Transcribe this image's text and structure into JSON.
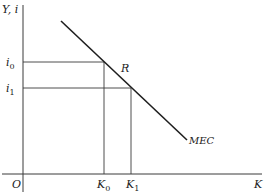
{
  "diagram": {
    "axes": {
      "y_label": "Y, i",
      "x_label": "K",
      "origin_label": "O"
    },
    "curve": {
      "label": "MEC",
      "start": [
        61,
        21
      ],
      "end": [
        187,
        140
      ]
    },
    "point": {
      "label": "R"
    },
    "levels": {
      "i0": {
        "base": "i",
        "sub": "0"
      },
      "i1": {
        "base": "i",
        "sub": "1"
      },
      "K0": {
        "base": "K",
        "sub": "0"
      },
      "K1": {
        "base": "K",
        "sub": "1"
      }
    },
    "colors": {
      "line": "#1e1e1e",
      "guide": "#3a3a3a",
      "background": "#ffffff"
    }
  }
}
